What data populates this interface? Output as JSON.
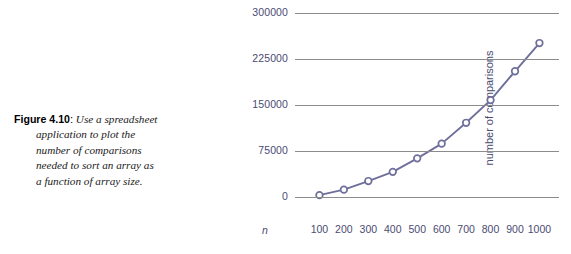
{
  "caption": {
    "label": "Figure 4.10",
    "colon": ":",
    "lines": [
      "Use a spreadsheet",
      "application to plot the",
      "number of comparisons",
      "needed to sort an array as",
      "a function of array size."
    ],
    "full_text": "Figure 4.10: Use a spreadsheet application to plot the number of comparisons needed to sort an array as a function of array size."
  },
  "colors": {
    "series": "#6f6f9c",
    "marker_fill": "#ffffff",
    "gridline": "#8c8c8c",
    "tick_text": "#4b4b73",
    "caption_text": "#1a1a1a",
    "background": "#ffffff"
  },
  "chart_data": {
    "type": "line",
    "title": "",
    "xlabel": "n",
    "ylabel": "number of comparisons",
    "x": [
      100,
      200,
      300,
      400,
      500,
      600,
      700,
      800,
      900,
      1000
    ],
    "xticklabels": [
      "100",
      "200",
      "300",
      "400",
      "500",
      "600",
      "700",
      "800",
      "900",
      "1000"
    ],
    "values": [
      3000,
      12000,
      26000,
      41000,
      63000,
      87000,
      121000,
      158000,
      205000,
      251000
    ],
    "yticks": [
      0,
      75000,
      150000,
      225000,
      300000
    ],
    "yticklabels": [
      "0",
      "75000",
      "150000",
      "225000",
      "300000"
    ],
    "ylim": [
      0,
      300000
    ],
    "xlim": [
      0,
      1080
    ],
    "grid": true,
    "grid_axis": "y",
    "legend": null,
    "marker": "open-circle",
    "series_name": "number of comparisons"
  }
}
